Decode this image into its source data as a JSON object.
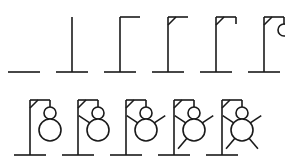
{
  "diagram": {
    "stroke_color": "#1a1a1a",
    "background_color": "#ffffff",
    "stroke_width": 1.6,
    "total_stages": 11,
    "rows": [
      {
        "name": "top-row",
        "stage_count": 6,
        "baseline_y": 72,
        "stage_indices": [
          0,
          1,
          2,
          3,
          4,
          5
        ]
      },
      {
        "name": "bottom-row",
        "stage_count": 5,
        "baseline_y": 155,
        "stage_indices": [
          6,
          7,
          8,
          9,
          10
        ]
      }
    ],
    "geometry": {
      "top_row_origin_x": 24,
      "top_row_step_x": 48,
      "top_row_baseline_y": 72,
      "bottom_row_origin_x": 30,
      "bottom_row_step_x": 48,
      "bottom_row_baseline_y": 155,
      "base_half_width": 16,
      "pole_height": 55,
      "beam_length": 20,
      "brace_size": 8,
      "rope_length": 7,
      "head_radius": 6,
      "body_radius": 11
    },
    "stages": [
      {
        "index": 1,
        "label": "base",
        "added_part": "ground line",
        "parts": [
          "base"
        ]
      },
      {
        "index": 2,
        "label": "pole",
        "added_part": "vertical post",
        "parts": [
          "base",
          "pole"
        ]
      },
      {
        "index": 3,
        "label": "beam",
        "added_part": "top beam",
        "parts": [
          "base",
          "pole",
          "beam"
        ]
      },
      {
        "index": 4,
        "label": "brace",
        "added_part": "diagonal brace",
        "parts": [
          "base",
          "pole",
          "beam",
          "brace"
        ]
      },
      {
        "index": 5,
        "label": "rope",
        "added_part": "rope",
        "parts": [
          "base",
          "pole",
          "beam",
          "brace",
          "rope"
        ]
      },
      {
        "index": 6,
        "label": "head",
        "added_part": "head",
        "parts": [
          "base",
          "pole",
          "beam",
          "brace",
          "rope",
          "head"
        ]
      },
      {
        "index": 7,
        "label": "body",
        "added_part": "body",
        "parts": [
          "base",
          "pole",
          "beam",
          "brace",
          "rope",
          "head",
          "body"
        ]
      },
      {
        "index": 8,
        "label": "left-arm",
        "added_part": "left arm",
        "parts": [
          "base",
          "pole",
          "beam",
          "brace",
          "rope",
          "head",
          "body",
          "arm_left"
        ]
      },
      {
        "index": 9,
        "label": "right-arm",
        "added_part": "right arm",
        "parts": [
          "base",
          "pole",
          "beam",
          "brace",
          "rope",
          "head",
          "body",
          "arm_left",
          "arm_right"
        ]
      },
      {
        "index": 10,
        "label": "left-leg",
        "added_part": "left leg",
        "parts": [
          "base",
          "pole",
          "beam",
          "brace",
          "rope",
          "head",
          "body",
          "arm_left",
          "arm_right",
          "leg_left"
        ]
      },
      {
        "index": 11,
        "label": "right-leg",
        "added_part": "right leg",
        "parts": [
          "base",
          "pole",
          "beam",
          "brace",
          "rope",
          "head",
          "body",
          "arm_left",
          "arm_right",
          "leg_left",
          "leg_right"
        ]
      }
    ]
  }
}
